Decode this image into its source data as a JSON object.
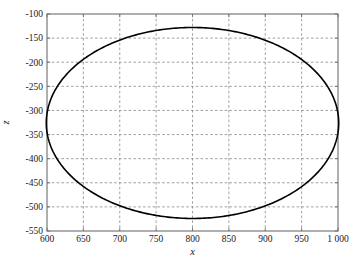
{
  "figure": {
    "background_color": "#ffffff",
    "frame_color": "#6e6e6e",
    "grid_color": "#8a8a8a",
    "curve_color": "#000000"
  },
  "chart_data": {
    "type": "line",
    "title": "",
    "subtitle": "",
    "xlabel": "x",
    "ylabel": "z",
    "xlim": [
      600,
      1000
    ],
    "ylim": [
      -550,
      -100
    ],
    "grid": true,
    "legend": null,
    "legend_position": "none",
    "xticks": [
      600,
      650,
      700,
      750,
      800,
      850,
      900,
      950,
      1000
    ],
    "xticklabels": [
      "600",
      "650",
      "700",
      "750",
      "800",
      "850",
      "900",
      "950",
      "1 000"
    ],
    "yticks": [
      -550,
      -500,
      -450,
      -400,
      -350,
      -300,
      -250,
      -200,
      -150,
      -100
    ],
    "yticklabels": [
      "-550",
      "-500",
      "-450",
      "-400",
      "-350",
      "-300",
      "-250",
      "-200",
      "-150",
      "-100"
    ],
    "series": [
      {
        "name": "closed orbit",
        "closed": true,
        "line_width": 1.6,
        "color": "#000000",
        "shape": "ellipse",
        "ellipse": {
          "center_x": 800,
          "center_y": -326,
          "semi_axis_x": 201,
          "semi_axis_y": 198,
          "rotation_deg": -2.5
        },
        "extremes": {
          "top": {
            "x": 806,
            "y": -128
          },
          "bottom": {
            "x": 791,
            "y": -523
          },
          "left": {
            "x": 601,
            "y": -318
          },
          "right": {
            "x": 1000,
            "y": -333
          }
        },
        "x": [
          1000,
          995,
          980,
          956,
          925,
          888,
          847,
          803,
          759,
          716,
          678,
          646,
          622,
          606,
          601,
          605,
          619,
          642,
          673,
          709,
          750,
          793,
          837,
          880,
          919,
          951,
          976,
          993,
          1000
        ],
        "y": [
          -333,
          -296,
          -262,
          -219,
          -184,
          -155,
          -136,
          -128,
          -131,
          -145,
          -168,
          -199,
          -235,
          -274,
          -318,
          -360,
          -400,
          -436,
          -466,
          -490,
          -508,
          -519,
          -523,
          -519,
          -507,
          -488,
          -462,
          -430,
          -333
        ]
      }
    ]
  },
  "axes": {
    "x_axis_name": "x-axis",
    "y_axis_name": "z-axis"
  }
}
